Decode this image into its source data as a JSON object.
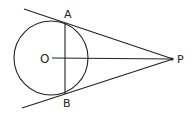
{
  "diagram": {
    "type": "geometry",
    "labels": {
      "center": "O",
      "tangent_point_top": "A",
      "tangent_point_bottom": "B",
      "external_point": "P"
    },
    "colors": {
      "stroke": "#222222",
      "background": "#ffffff"
    }
  }
}
